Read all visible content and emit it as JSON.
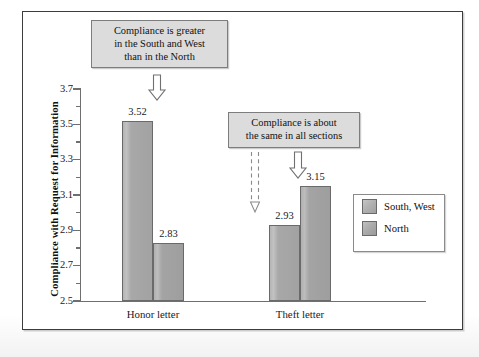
{
  "figure": {
    "frame_color": "#3c3c3c",
    "background": "#ffffff"
  },
  "legend": {
    "position": "right-middle",
    "entries": [
      {
        "label": "South, West",
        "color": "#aaaaaa"
      },
      {
        "label": "North",
        "color": "#a5a5a5"
      }
    ]
  },
  "annotations": [
    {
      "id": "callout-south-west-greater",
      "lines": [
        "Compliance is greater",
        "in the South and West",
        "than in the North"
      ],
      "text": "Compliance is greater in the South and West than in the North",
      "arrow_style": "solid",
      "points_to": "honor-letter-south-west"
    },
    {
      "id": "callout-same-all-sections",
      "lines": [
        "Compliance is about",
        "the same in all sections"
      ],
      "text": "Compliance is about the same in all sections",
      "arrow_style_left": "dashed",
      "arrow_style_right": "solid",
      "points_to": [
        "theft-letter-south-west",
        "theft-letter-north"
      ]
    }
  ],
  "chart_data": {
    "type": "bar",
    "title": "",
    "xlabel": "",
    "ylabel": "Compliance with Request for Information",
    "ylim": [
      2.5,
      3.7
    ],
    "ytick_major": [
      "2.5",
      "2.7",
      "2.9",
      "3.1",
      "3.3",
      "3.5",
      "3.7"
    ],
    "ytick_minor": [
      "2.6",
      "2.8",
      "3.0",
      "3.2",
      "3.4",
      "3.6"
    ],
    "grid": false,
    "legend_position": "right",
    "categories": [
      "Honor letter",
      "Theft letter"
    ],
    "series": [
      {
        "name": "South, West",
        "values": [
          3.52,
          2.93
        ],
        "labels": [
          "3.52",
          "2.93"
        ]
      },
      {
        "name": "North",
        "values": [
          2.83,
          3.15
        ],
        "labels": [
          "2.83",
          "3.15"
        ]
      }
    ]
  }
}
